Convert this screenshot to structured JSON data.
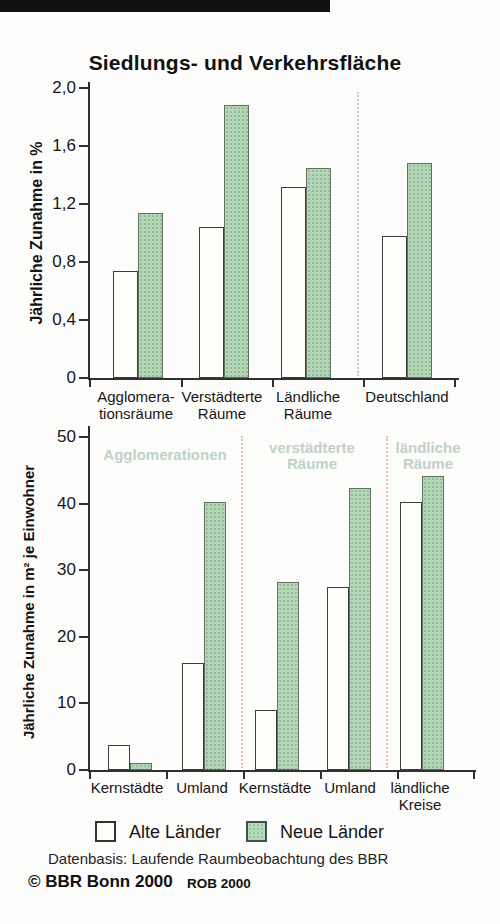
{
  "title": "Siedlungs- und Verkehrsfläche",
  "legend": {
    "items": [
      {
        "label": "Alte Länder",
        "color": "#fdfdfa"
      },
      {
        "label": "Neue Länder",
        "color": "#b3d6b7"
      }
    ]
  },
  "footer": {
    "source": "Datenbasis: Laufende Raumbeobachtung des BBR",
    "copyright": "© BBR Bonn 2000",
    "code": "ROB 2000"
  },
  "colors": {
    "alte_laender_fill": "#fdfdfa",
    "neue_laender_fill": "#b3d6b7",
    "bar_border": "#3d3d3d",
    "axis": "#303030",
    "region_label": "#c2d1c8",
    "separator_top_chart": "#d6c6c6",
    "separator_bottom_chart": "#e0bcbc"
  },
  "chart_data": [
    {
      "type": "bar",
      "title": "Siedlungs- und Verkehrsfläche",
      "ylabel": "Jährliche Zunahme in %",
      "xlabel": "",
      "ylim": [
        0,
        2.0
      ],
      "grid": false,
      "yticks": [
        {
          "v": 2.0,
          "label": "2,0"
        },
        {
          "v": 1.6,
          "label": "1,6"
        },
        {
          "v": 1.2,
          "label": "1,2"
        },
        {
          "v": 0.8,
          "label": "0,8"
        },
        {
          "v": 0.4,
          "label": "0,4"
        },
        {
          "v": 0,
          "label": "0"
        }
      ],
      "categories": [
        [
          "Agglomera-",
          "tionsräume"
        ],
        [
          "Verstädterte",
          "Räume"
        ],
        [
          "Ländliche",
          "Räume"
        ],
        [
          "Deutschland"
        ]
      ],
      "series": [
        {
          "name": "Alte Länder",
          "values": [
            0.74,
            1.04,
            1.32,
            0.98
          ]
        },
        {
          "name": "Neue Länder",
          "values": [
            1.14,
            1.88,
            1.45,
            1.48
          ]
        }
      ],
      "separators_after_category": [
        2
      ]
    },
    {
      "type": "bar",
      "title": "",
      "ylabel": "Jährliche Zunahme in m² je Einwohner",
      "xlabel": "",
      "ylim": [
        0,
        50
      ],
      "grid": false,
      "yticks": [
        {
          "v": 50,
          "label": "50"
        },
        {
          "v": 40,
          "label": "40"
        },
        {
          "v": 30,
          "label": "30"
        },
        {
          "v": 20,
          "label": "20"
        },
        {
          "v": 10,
          "label": "10"
        },
        {
          "v": 0,
          "label": "0"
        }
      ],
      "categories": [
        [
          "Kernstädte"
        ],
        [
          "Umland"
        ],
        [
          "Kernstädte"
        ],
        [
          "Umland"
        ],
        [
          "ländliche",
          "Kreise"
        ]
      ],
      "series": [
        {
          "name": "Alte Länder",
          "values": [
            3.8,
            16,
            9,
            27.5,
            40.2
          ]
        },
        {
          "name": "Neue Länder",
          "values": [
            1.1,
            40.3,
            28.2,
            42.4,
            44.2
          ]
        }
      ],
      "separators_after_category": [
        1,
        3
      ],
      "region_headers": [
        {
          "lines": [
            "Agglomerationen"
          ]
        },
        {
          "lines": [
            "verstädterte",
            "Räume"
          ]
        },
        {
          "lines": [
            "ländliche",
            "Räume"
          ]
        }
      ]
    }
  ]
}
